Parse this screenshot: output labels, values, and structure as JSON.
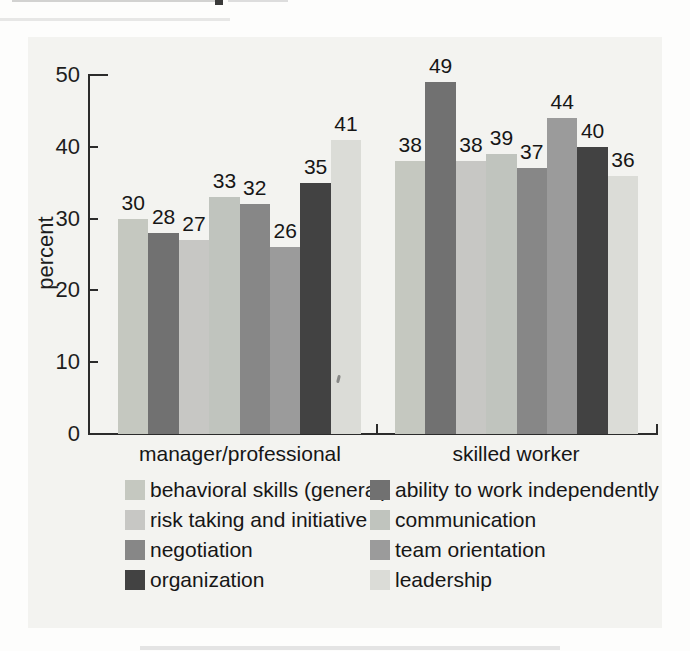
{
  "chart_data": {
    "type": "bar",
    "title": "",
    "xlabel": "",
    "ylabel": "percent",
    "ylim": [
      0,
      50
    ],
    "yticks": [
      0,
      10,
      20,
      30,
      40,
      50
    ],
    "grid": false,
    "legend_position": "bottom",
    "categories": [
      "manager/professional",
      "skilled worker"
    ],
    "series": [
      {
        "name": "behavioral skills (general)",
        "color": "#c5c8c0",
        "values": [
          30,
          38
        ]
      },
      {
        "name": "ability to work independently",
        "color": "#717171",
        "values": [
          28,
          49
        ]
      },
      {
        "name": "risk taking and initiative",
        "color": "#c7c7c4",
        "values": [
          27,
          38
        ]
      },
      {
        "name": "communication",
        "color": "#c0c4be",
        "values": [
          33,
          39
        ]
      },
      {
        "name": "negotiation",
        "color": "#878787",
        "values": [
          32,
          37
        ]
      },
      {
        "name": "team orientation",
        "color": "#9b9b9b",
        "values": [
          26,
          44
        ]
      },
      {
        "name": "organization",
        "color": "#424242",
        "values": [
          35,
          40
        ]
      },
      {
        "name": "leadership",
        "color": "#dbdcd7",
        "values": [
          41,
          36
        ]
      }
    ]
  }
}
